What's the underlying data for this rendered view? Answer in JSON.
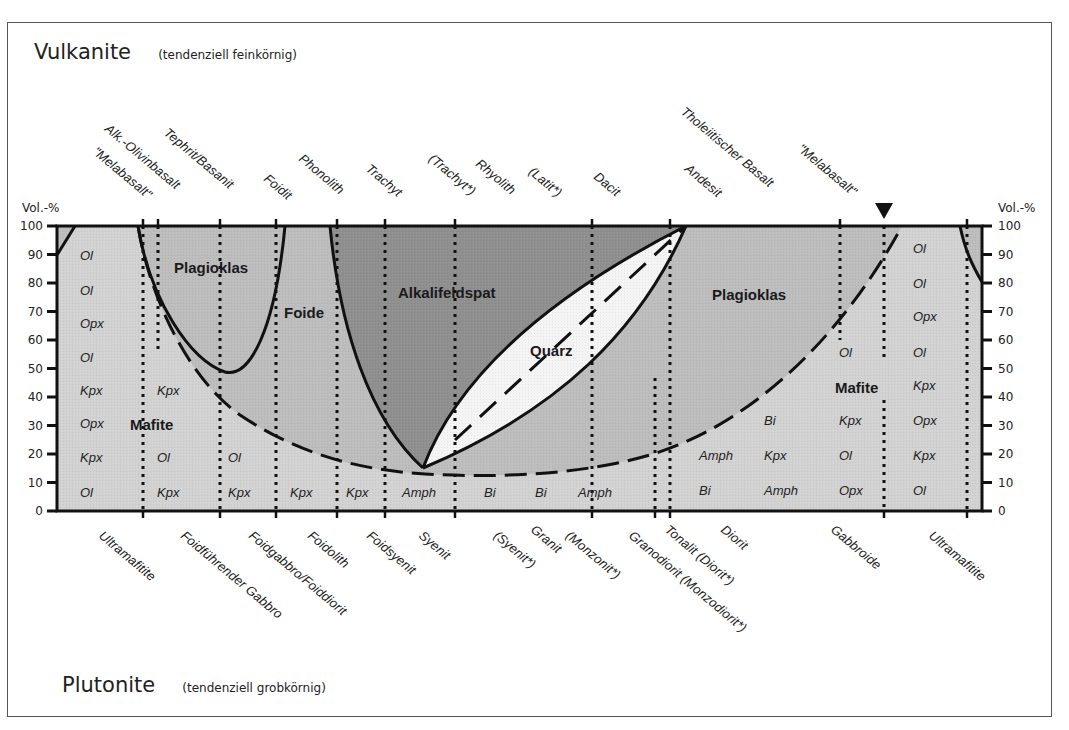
{
  "header": {
    "title": "Vulkanite",
    "subtitle": "(tendenziell feinkörnig)"
  },
  "footer": {
    "title": "Plutonite",
    "subtitle": "(tendenziell grobkörnig)"
  },
  "axis": {
    "left_label": "Vol.-%",
    "right_label": "Vol.-%",
    "ticks": [
      "0",
      "10",
      "20",
      "30",
      "40",
      "50",
      "60",
      "70",
      "80",
      "90",
      "100"
    ]
  },
  "regions": {
    "plagioklas_left": "Plagioklas",
    "foide": "Foide",
    "alkalifeldspat": "Alkalifeldspat",
    "quarz": "Quarz",
    "plagioklas_right": "Plagioklas",
    "mafite_left": "Mafite",
    "mafite_right": "Mafite"
  },
  "volcanic_names": [
    "\"Melabasalt\"",
    "Alk.-Olivinbasalt",
    "Tephrit/Basanit",
    "Foidit",
    "Phonolith",
    "Trachyt",
    "(Trachyt*)",
    "Rhyolith",
    "(Latit*)",
    "Dacit",
    "Andesit",
    "Tholeiitischer Basalt",
    "\"Melabasalt\""
  ],
  "plutonic_names": [
    "Ultramafitite",
    "Foidführender Gabbro",
    "Foidgabbro/Foiddiorit",
    "Foidolith",
    "Foidsyenit",
    "Syenit",
    "(Syenit*)",
    "Granit",
    "(Monzonit*)",
    "Granodiorit (Monzodiorit*)",
    "Tonalit (Diorit*)",
    "Diorit",
    "Gabbroide",
    "Ultramafitite"
  ],
  "mineral_columns": [
    {
      "column": "ultramafic-left",
      "minerals": [
        "Ol",
        "Ol",
        "Opx",
        "Ol",
        "Kpx",
        "Opx",
        "Kpx",
        "Ol"
      ]
    },
    {
      "column": "foid-gabbro",
      "minerals": [
        "Kpx",
        "Ol",
        "Kpx"
      ]
    },
    {
      "column": "foidgabbro-foiddiorit",
      "minerals": [
        "Ol",
        "Kpx"
      ]
    },
    {
      "column": "foidolith",
      "minerals": [
        "Kpx"
      ]
    },
    {
      "column": "foidsyenit",
      "minerals": [
        "Kpx"
      ]
    },
    {
      "column": "syenit",
      "minerals": [
        "Amph"
      ]
    },
    {
      "column": "granit-1",
      "minerals": [
        "Bi"
      ]
    },
    {
      "column": "granit-2",
      "minerals": [
        "Bi"
      ]
    },
    {
      "column": "monzonit",
      "minerals": [
        "Amph"
      ]
    },
    {
      "column": "diorit-1",
      "minerals": [
        "Amph",
        "Bi"
      ]
    },
    {
      "column": "diorit-2",
      "minerals": [
        "Bi",
        "Kpx",
        "Amph"
      ]
    },
    {
      "column": "gabbroide",
      "minerals": [
        "Ol",
        "Kpx",
        "Ol",
        "Opx"
      ]
    },
    {
      "column": "ultramafic-right",
      "minerals": [
        "Ol",
        "Ol",
        "Opx",
        "Ol",
        "Kpx",
        "Opx",
        "Kpx",
        "Ol"
      ]
    }
  ],
  "colors": {
    "light_fill": "#d2d2d2",
    "mid_fill": "#bdbdbd",
    "dark_fill": "#8f8f8f",
    "quarz_fill": "#f4f4f4",
    "line": "#111111",
    "frame": "#555555"
  }
}
